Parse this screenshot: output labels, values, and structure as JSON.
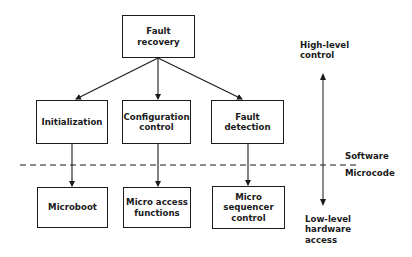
{
  "diagram": {
    "top": {
      "id": "fault-recovery",
      "label": "Fault recovery"
    },
    "software_layer": [
      {
        "id": "initialization",
        "label": "Initialization"
      },
      {
        "id": "configuration-control",
        "label": "Configuration\ncontrol"
      },
      {
        "id": "fault-detection",
        "label": "Fault\ndetection"
      }
    ],
    "microcode_layer": [
      {
        "id": "microboot",
        "label": "Microboot"
      },
      {
        "id": "micro-access-functions",
        "label": "Micro access\nfunctions"
      },
      {
        "id": "micro-sequencer-control",
        "label": "Micro\nsequencer\ncontrol"
      }
    ],
    "edges": [
      {
        "from": "fault-recovery",
        "to": "initialization"
      },
      {
        "from": "fault-recovery",
        "to": "configuration-control"
      },
      {
        "from": "fault-recovery",
        "to": "fault-detection"
      },
      {
        "from": "initialization",
        "to": "microboot"
      },
      {
        "from": "configuration-control",
        "to": "micro-access-functions"
      },
      {
        "from": "fault-detection",
        "to": "micro-sequencer-control"
      }
    ],
    "boundary": {
      "above_label": "Software",
      "below_label": "Microcode"
    },
    "scale": {
      "top_label": "High-level\ncontrol",
      "bottom_label": "Low-level\nhardware\naccess"
    }
  }
}
